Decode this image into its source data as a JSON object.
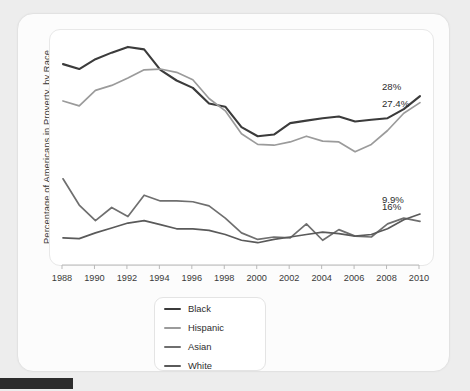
{
  "chart_data": {
    "type": "line",
    "title": "",
    "subtitle": "",
    "xlabel": "",
    "ylabel": "Percentage of Americans in Proverty, by Race",
    "x": [
      1988,
      1989,
      1990,
      1991,
      1992,
      1993,
      1994,
      1995,
      1996,
      1997,
      1998,
      1999,
      2000,
      2001,
      2002,
      2003,
      2004,
      2005,
      2006,
      2007,
      2008,
      2009,
      2010
    ],
    "xlim": [
      1988,
      2010
    ],
    "ylim": [
      8,
      34
    ],
    "xtick_labels": [
      "1988",
      "1990",
      "1992",
      "1994",
      "1996",
      "1998",
      "2000",
      "2002",
      "2004",
      "2006",
      "2008",
      "2010"
    ],
    "xticks": [
      1988,
      1990,
      1992,
      1994,
      1996,
      1998,
      2000,
      2002,
      2004,
      2006,
      2008,
      2010
    ],
    "grid": false,
    "legend_position": "bottom",
    "series": [
      {
        "name": "Black",
        "color": "#3b3b3b",
        "end_label": "27.4%",
        "values": [
          31.3,
          30.7,
          31.9,
          32.7,
          33.4,
          33.1,
          30.6,
          29.3,
          28.4,
          26.5,
          26.1,
          23.6,
          22.5,
          22.7,
          24.1,
          24.4,
          24.7,
          24.9,
          24.3,
          24.5,
          24.7,
          25.8,
          27.4
        ]
      },
      {
        "name": "Hispanic",
        "color": "#9b9b9b",
        "end_label": "28%",
        "values": [
          26.8,
          26.2,
          28.1,
          28.7,
          29.6,
          30.6,
          30.7,
          30.3,
          29.4,
          27.1,
          25.6,
          22.8,
          21.5,
          21.4,
          21.8,
          22.5,
          21.9,
          21.8,
          20.6,
          21.5,
          23.2,
          25.3,
          26.6
        ]
      },
      {
        "name": "Asian",
        "color": "#6f6f6f",
        "end_label": "16%",
        "values": [
          17.3,
          14.1,
          12.2,
          13.8,
          12.7,
          15.3,
          14.6,
          14.6,
          14.5,
          14.0,
          12.5,
          10.7,
          9.9,
          10.2,
          10.1,
          11.8,
          9.8,
          11.1,
          10.3,
          10.2,
          11.8,
          12.5,
          12.1
        ]
      },
      {
        "name": "White",
        "color": "#5a5a5a",
        "end_label": "9.9%",
        "values": [
          10.1,
          10.0,
          10.7,
          11.3,
          11.9,
          12.2,
          11.7,
          11.2,
          11.2,
          11.0,
          10.5,
          9.8,
          9.5,
          9.9,
          10.2,
          10.5,
          10.8,
          10.6,
          10.3,
          10.5,
          11.2,
          12.3,
          13.0
        ]
      }
    ],
    "end_labels": [
      {
        "text": "28%",
        "series": "Hispanic"
      },
      {
        "text": "27.4%",
        "series": "Black"
      },
      {
        "text": "16%",
        "series": "Asian"
      },
      {
        "text": "9.9%",
        "series": "White"
      }
    ],
    "legend_entries": [
      {
        "label": "Black",
        "color": "#3b3b3b"
      },
      {
        "label": "Hispanic",
        "color": "#9b9b9b"
      },
      {
        "label": "Asian",
        "color": "#6f6f6f"
      },
      {
        "label": "White",
        "color": "#5a5a5a"
      }
    ]
  },
  "colors": {
    "background": "#ededed",
    "card": "#fcfcfc",
    "panel": "#ffffff",
    "text": "#2e2e2e",
    "axis": "#b9b9b9"
  }
}
